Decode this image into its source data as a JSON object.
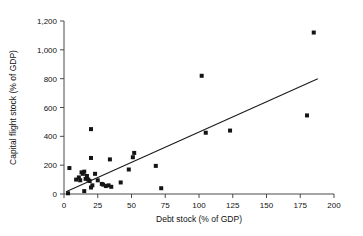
{
  "chart_data": {
    "type": "scatter",
    "title": "",
    "xlabel": "Debt stock (% of GDP)",
    "ylabel": "Capital flight stock (% of GDP)",
    "xlim": [
      0,
      200
    ],
    "ylim": [
      0,
      1200
    ],
    "xticks": [
      0,
      25,
      50,
      75,
      100,
      125,
      150,
      175,
      200
    ],
    "xtick_labels": [
      "0",
      "25",
      "50",
      "75",
      "100",
      "125",
      "150",
      "175",
      "200"
    ],
    "yticks": [
      0,
      200,
      400,
      600,
      800,
      1000,
      1200
    ],
    "ytick_labels": [
      "0",
      "200",
      "400",
      "600",
      "800",
      "1,000",
      "1,200"
    ],
    "grid": false,
    "legend": null,
    "marker": "square",
    "marker_color": "#141414",
    "marker_size": 4,
    "points": [
      {
        "x": 3,
        "y": 5
      },
      {
        "x": 4,
        "y": 180
      },
      {
        "x": 9,
        "y": 100
      },
      {
        "x": 11,
        "y": 115
      },
      {
        "x": 12,
        "y": 95
      },
      {
        "x": 13,
        "y": 150
      },
      {
        "x": 14,
        "y": 140
      },
      {
        "x": 15,
        "y": 155
      },
      {
        "x": 15,
        "y": 20
      },
      {
        "x": 16,
        "y": 105
      },
      {
        "x": 17,
        "y": 125
      },
      {
        "x": 18,
        "y": 100
      },
      {
        "x": 19,
        "y": 90
      },
      {
        "x": 20,
        "y": 450
      },
      {
        "x": 20,
        "y": 250
      },
      {
        "x": 20,
        "y": 45
      },
      {
        "x": 21,
        "y": 60
      },
      {
        "x": 23,
        "y": 140
      },
      {
        "x": 25,
        "y": 95
      },
      {
        "x": 28,
        "y": 70
      },
      {
        "x": 29,
        "y": 65
      },
      {
        "x": 31,
        "y": 55
      },
      {
        "x": 33,
        "y": 60
      },
      {
        "x": 34,
        "y": 240
      },
      {
        "x": 35,
        "y": 50
      },
      {
        "x": 42,
        "y": 80
      },
      {
        "x": 48,
        "y": 170
      },
      {
        "x": 51,
        "y": 255
      },
      {
        "x": 52,
        "y": 285
      },
      {
        "x": 68,
        "y": 195
      },
      {
        "x": 72,
        "y": 40
      },
      {
        "x": 102,
        "y": 820
      },
      {
        "x": 105,
        "y": 425
      },
      {
        "x": 123,
        "y": 440
      },
      {
        "x": 180,
        "y": 545
      },
      {
        "x": 185,
        "y": 1120
      }
    ],
    "trend_line": {
      "x_start": 1.5,
      "y_start": 15,
      "x_end": 188,
      "y_end": 800,
      "color": "#1a1a1a"
    }
  }
}
